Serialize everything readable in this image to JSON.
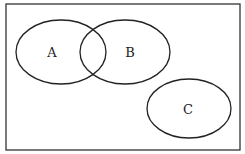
{
  "diagram": {
    "type": "venn",
    "universe": {
      "x": 6,
      "y": 4,
      "width": 234,
      "height": 146
    },
    "sets": [
      {
        "label": "A",
        "cx": 61,
        "cy": 52,
        "rx": 45,
        "ry": 32,
        "label_x": 52,
        "label_y": 52
      },
      {
        "label": "B",
        "cx": 125,
        "cy": 52,
        "rx": 45,
        "ry": 32,
        "label_x": 130,
        "label_y": 52
      },
      {
        "label": "C",
        "cx": 189,
        "cy": 108.5,
        "rx": 42,
        "ry": 29.5,
        "label_x": 188,
        "label_y": 109
      }
    ],
    "relations": [
      "A and B overlap",
      "C is disjoint from A and B"
    ],
    "stroke_color": "#222222"
  }
}
